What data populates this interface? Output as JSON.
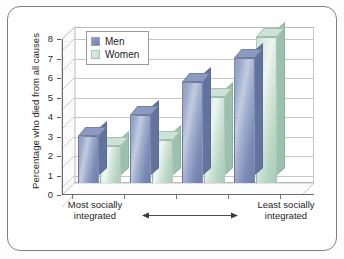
{
  "figure": {
    "frame_color": "#8d7787",
    "background": "#ffffff"
  },
  "legend": {
    "position": "top-left-inside",
    "entries": [
      {
        "label": "Men",
        "color": "#7b8cb8",
        "icon": "legend-swatch-men"
      },
      {
        "label": "Women",
        "color": "#c5ded0",
        "icon": "legend-swatch-women"
      }
    ]
  },
  "axis": {
    "y_label": "Percentage who died from all causes",
    "y_ticks": [
      "0",
      "1",
      "2",
      "3",
      "4",
      "5",
      "6",
      "7",
      "8"
    ],
    "x_left_label": "Most socially integrated",
    "x_right_label": "Least socially integrated",
    "arrow": "double-headed-horizontal-arrow"
  },
  "chart_data": {
    "type": "bar",
    "title": "",
    "subtitle": "",
    "xlabel": "Social integration level",
    "ylabel": "Percentage who died from all causes",
    "ylim": [
      0,
      8
    ],
    "ytick_step": 1,
    "grid": true,
    "legend_position": "upper left",
    "three_d": true,
    "categories": [
      "Most socially integrated",
      "",
      "",
      "Least socially integrated"
    ],
    "category_axis_note": "Ordered gradient from most socially integrated (left) to least socially integrated (right)",
    "series": [
      {
        "name": "Men",
        "color": "#7b8cb8",
        "values": [
          2.4,
          3.5,
          5.2,
          6.4
        ]
      },
      {
        "name": "Women",
        "color": "#c5ded0",
        "values": [
          1.9,
          2.2,
          4.4,
          7.5
        ]
      }
    ],
    "annotations": []
  }
}
